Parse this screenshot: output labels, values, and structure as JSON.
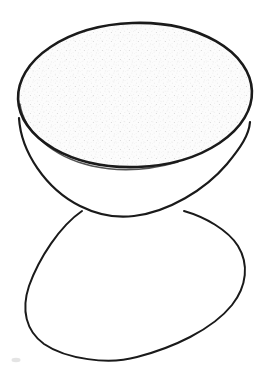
{
  "figure": {
    "caption": "",
    "background_color": "#ffffff",
    "ink_color": "#1a1a1a",
    "fill_color": "#fbfbfb",
    "speck_color": "#c9c9c9",
    "canvas": {
      "width": 266,
      "height": 370
    },
    "parts": [
      {
        "name": "top-ellipse-rim",
        "label": "Elliptical top opening of the bowl",
        "type": "ellipse",
        "center_x": 135,
        "center_y": 95,
        "radius_x": 117,
        "radius_y": 72,
        "rotation_deg": -2,
        "stroke_width": 2.6,
        "filled": true
      },
      {
        "name": "bowl-outer-wall",
        "label": "Outer hemispherical wall of the bowl",
        "type": "arc",
        "left_junction_x": 19,
        "left_junction_y": 118,
        "right_junction_x": 250,
        "right_junction_y": 122,
        "bottom_x": 134,
        "bottom_y": 216,
        "stroke_width": 2.2
      },
      {
        "name": "lower-reflected-curve",
        "label": "Lower curve forming the hourglass silhouette",
        "type": "closed-curve",
        "left_cross_x": 82,
        "left_cross_y": 211,
        "right_cross_x": 184,
        "right_cross_y": 211,
        "left_extreme_x": 27,
        "left_extreme_y": 292,
        "right_extreme_x": 247,
        "right_extreme_y": 295,
        "bottom_x": 137,
        "bottom_y": 357,
        "stroke_width": 2.0
      }
    ],
    "texture": {
      "name": "stipple",
      "description": "Faint gray speckle fill inside the top elliptical surface",
      "density": "very-low"
    }
  }
}
